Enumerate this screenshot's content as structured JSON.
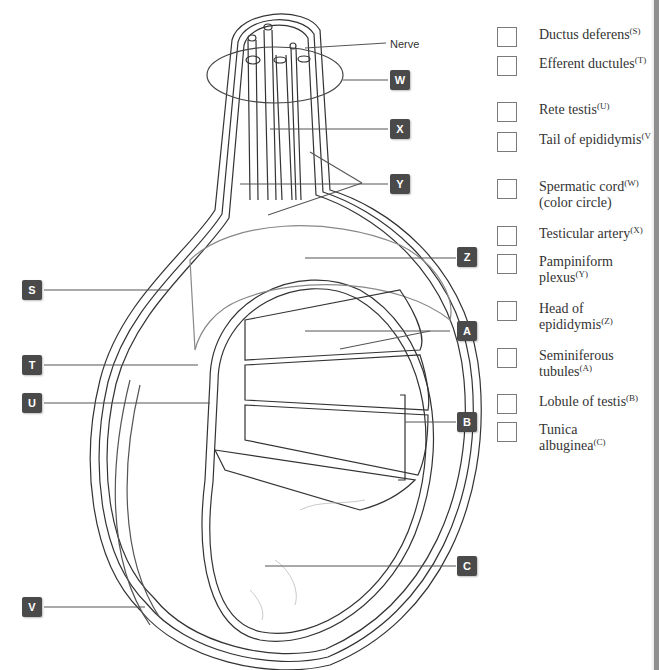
{
  "diagram": {
    "callout_labels": {
      "nerve": "Nerve",
      "W": "W",
      "X": "X",
      "Y": "Y",
      "Z": "Z",
      "S": "S",
      "T": "T",
      "U": "U",
      "V": "V",
      "A": "A",
      "B": "B",
      "C": "C"
    }
  },
  "legend": {
    "items": [
      {
        "text": "Ductus deferens",
        "letter": "(S)"
      },
      {
        "text": "Efferent ductules",
        "letter": "(T)"
      },
      {
        "text": "Rete testis",
        "letter": "(U)"
      },
      {
        "text": "Tail of epididymis",
        "letter": "(V)"
      },
      {
        "text": "Spermatic cord",
        "letter": "(W)",
        "extra": "(color circle)"
      },
      {
        "text": "Testicular artery",
        "letter": "(X)"
      },
      {
        "text": "Pampiniform plexus",
        "letter": "(Y)"
      },
      {
        "text": "Head of epididymis",
        "letter": "(Z)"
      },
      {
        "text": "Seminiferous tubules",
        "letter": "(A)"
      },
      {
        "text": "Lobule of testis",
        "letter": "(B)"
      },
      {
        "text": "Tunica albuginea",
        "letter": "(C)"
      }
    ]
  },
  "colors": {
    "badge": "#4a4a4a",
    "line": "#333333",
    "light_line": "#9a9a9a"
  }
}
